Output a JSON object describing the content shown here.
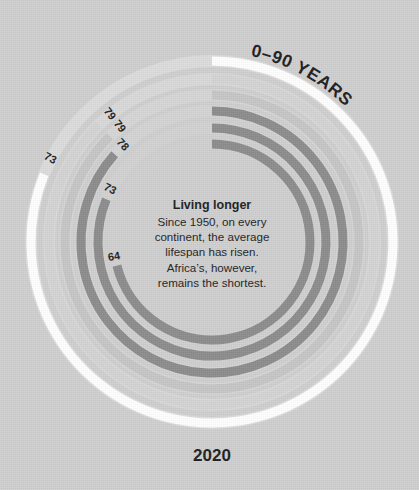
{
  "background_color": "#cfcfcf",
  "title": "0–90 YEARS",
  "bottom_year": "2020",
  "center": {
    "heading": "Living longer",
    "lines": [
      "Since 1950, on every",
      "continent, the average",
      "lifespan has risen.",
      "Africa’s, however,",
      "remains the shortest."
    ]
  },
  "chart_data": {
    "type": "bar",
    "title": "0–90 YEARS",
    "subtitle": "Living longer",
    "xlabel": "",
    "ylabel": "Life expectancy (years)",
    "scale_min": 0,
    "scale_max": 90,
    "units": "years",
    "year": "2020",
    "layout": "radial concentric arcs, start at 12 o'clock, clockwise, full 360° = 90 years",
    "grid": false,
    "legend": "none",
    "categories": [
      "73",
      "79",
      "79",
      "78",
      "73",
      "64"
    ],
    "values": [
      73,
      79,
      79,
      78,
      73,
      64
    ],
    "series": [
      {
        "name": "arcs",
        "values": [
          73,
          79,
          79,
          78,
          73,
          64
        ]
      }
    ],
    "rings": [
      {
        "label": "73",
        "value": 73,
        "ring": 1,
        "radius": 181,
        "thickness": 9,
        "color": "#ffffff",
        "track": "#dcdcdc"
      },
      {
        "label": "79",
        "value": 79,
        "ring": 2,
        "radius": 163,
        "thickness": 9,
        "color": "#d4d4d4",
        "track": "#d9d9d9"
      },
      {
        "label": "79",
        "value": 79,
        "ring": 3,
        "radius": 147,
        "thickness": 9,
        "color": "#c6c6c6",
        "track": "#d6d6d6"
      },
      {
        "label": "78",
        "value": 78,
        "ring": 4,
        "radius": 131,
        "thickness": 9,
        "color": "#8c8c8c",
        "track": "#d4d4d4"
      },
      {
        "label": "73",
        "value": 73,
        "ring": 5,
        "radius": 114,
        "thickness": 9,
        "color": "#8c8c8c",
        "track": "#d2d2d2"
      },
      {
        "label": "64",
        "value": 64,
        "ring": 6,
        "radius": 98,
        "thickness": 9,
        "color": "#8c8c8c",
        "track": "#d0d0d0"
      }
    ],
    "annotations": [
      "Since 1950, on every continent, the average lifespan has risen.",
      "Africa’s, however, remains the shortest."
    ]
  }
}
